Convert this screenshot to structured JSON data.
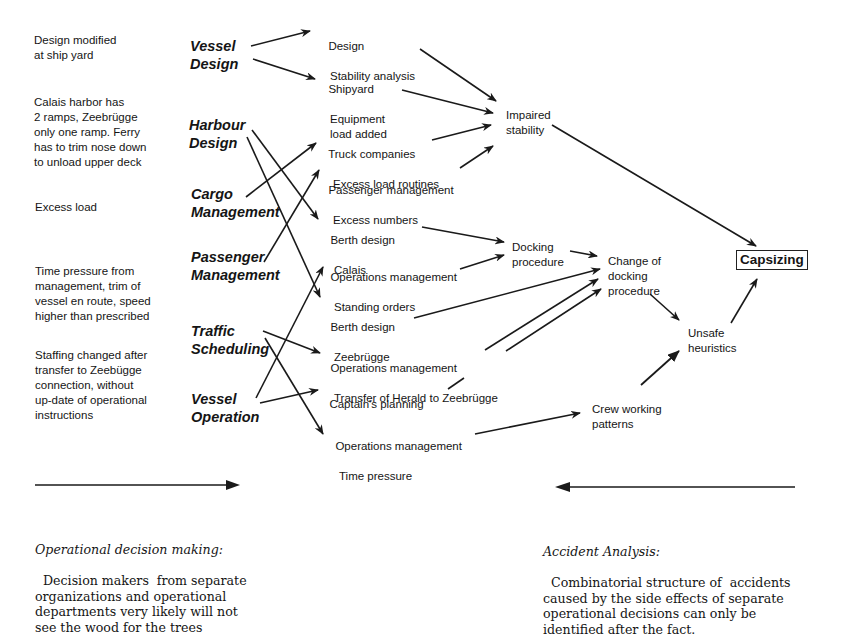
{
  "causes": [
    {
      "text": "Design modified\nat ship yard"
    },
    {
      "text": "Calais harbor has\n2 ramps, Zeebrügge\nonly one ramp. Ferry\nhas to trim nose down\nto unload upper deck"
    },
    {
      "text": "Excess load"
    },
    {
      "text": "Time pressure from\nmanagement, trim of\nvessel en route, speed\nhigher than prescribed"
    },
    {
      "text": "Staffing changed after\ntransfer to Zeebügge\nconnection, without\nup-date of operational\ninstructions"
    }
  ],
  "actors": [
    {
      "text": "Vessel\nDesign"
    },
    {
      "text": "Harbour\nDesign"
    },
    {
      "text": "Cargo\nManagement"
    },
    {
      "text": "Passenger\nManagement"
    },
    {
      "text": "Traffic\nScheduling"
    },
    {
      "text": "Vessel\nOperation"
    }
  ],
  "decisions": [
    {
      "title": "Design",
      "sub": "Stability analysis"
    },
    {
      "title": "Shipyard",
      "sub": "Equipment\nload added"
    },
    {
      "title": "Truck companies",
      "sub": "Excess load routines"
    },
    {
      "title": "Passenger management",
      "sub": "Excess numbers"
    },
    {
      "title": "Berth design",
      "sub": "Calais"
    },
    {
      "title": "Operations management",
      "sub": "Standing orders"
    },
    {
      "title": "Berth design",
      "sub": "Zeebrügge"
    },
    {
      "title": "Operations management",
      "sub": "Transfer of Herald to Zeebrügge"
    },
    {
      "title": "Captain's planning",
      "sub": ""
    },
    {
      "title": "Operations management",
      "sub": "Time pressure"
    }
  ],
  "intermediates": [
    {
      "text": "Impaired\nstability"
    },
    {
      "text": "Docking\nprocedure"
    },
    {
      "text": "Change of\ndocking\nprocedure"
    },
    {
      "text": "Unsafe\nheuristics"
    },
    {
      "text": "Crew working\npatterns"
    }
  ],
  "outcome": {
    "text": "Capsizing"
  },
  "captions": {
    "left": {
      "title": "Operational decision making:",
      "body": "Decision makers  from separate\norganizations and operational\ndepartments very likely will not\nsee the wood for the trees"
    },
    "right": {
      "title": "Accident Analysis:",
      "body": "Combinatorial structure of  accidents\ncaused by the side effects of separate\noperational decisions can only be\nidentified after the fact."
    }
  }
}
